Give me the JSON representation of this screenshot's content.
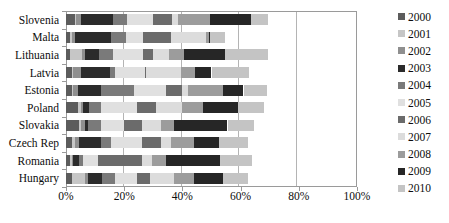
{
  "chart_data": {
    "type": "bar",
    "orientation": "horizontal",
    "stacked": true,
    "normalized_percent": true,
    "title": "",
    "subtitle": "",
    "xlabel": "",
    "ylabel": "",
    "xlim": [
      0,
      100
    ],
    "xticks": [
      0,
      20,
      40,
      60,
      80,
      100
    ],
    "xtick_labels": [
      "0%",
      "20%",
      "40%",
      "60%",
      "80%",
      "100%"
    ],
    "grid": true,
    "grid_axis": "x",
    "legend_position": "right",
    "categories": [
      "Slovenia",
      "Malta",
      "Lithuania",
      "Latvia",
      "Estonia",
      "Poland",
      "Slovakia",
      "Czech Rep",
      "Romania",
      "Hungary"
    ],
    "series": [
      {
        "name": "2000",
        "color": "#5c5c5c",
        "values": [
          3.0,
          1.5,
          1.5,
          2.0,
          2.0,
          4.0,
          4.5,
          2.0,
          1.5,
          2.0
        ]
      },
      {
        "name": "2001",
        "color": "#c6c6c6",
        "values": [
          0.5,
          0.5,
          4.0,
          0.5,
          0.5,
          1.0,
          0.5,
          1.0,
          0.5,
          4.5
        ]
      },
      {
        "name": "2002",
        "color": "#8f8f8f",
        "values": [
          1.5,
          1.0,
          1.0,
          2.5,
          1.5,
          1.0,
          1.5,
          1.5,
          0.5,
          1.0
        ]
      },
      {
        "name": "2003",
        "color": "#2b2b2b",
        "values": [
          11.0,
          12.5,
          5.0,
          10.0,
          8.0,
          2.0,
          1.0,
          7.5,
          2.0,
          5.0
        ]
      },
      {
        "name": "2004",
        "color": "#7a7a7a",
        "values": [
          5.0,
          5.0,
          4.5,
          2.0,
          11.5,
          4.0,
          4.5,
          3.5,
          1.5,
          4.5
        ]
      },
      {
        "name": "2005",
        "color": "#e0e0e0",
        "values": [
          9.0,
          6.0,
          10.5,
          10.0,
          11.0,
          12.5,
          8.0,
          10.5,
          5.0,
          7.5
        ]
      },
      {
        "name": "2006",
        "color": "#6b6b6b",
        "values": [
          6.5,
          9.5,
          3.5,
          0.5,
          5.5,
          6.5,
          6.0,
          6.5,
          15.0,
          4.5
        ]
      },
      {
        "name": "2007",
        "color": "#dcdcdc",
        "values": [
          2.0,
          12.0,
          5.5,
          12.0,
          2.0,
          9.0,
          6.5,
          3.5,
          3.5,
          8.0
        ]
      },
      {
        "name": "2008",
        "color": "#9c9c9c",
        "values": [
          11.0,
          1.0,
          5.0,
          5.0,
          12.0,
          7.0,
          4.5,
          8.0,
          5.0,
          7.0
        ]
      },
      {
        "name": "2009",
        "color": "#262626",
        "values": [
          14.0,
          0.5,
          14.0,
          5.5,
          7.0,
          12.0,
          18.5,
          8.5,
          18.5,
          10.0
        ]
      },
      {
        "name": "2010",
        "color": "#c4c4c4",
        "values": [
          6.0,
          5.0,
          15.0,
          13.0,
          8.0,
          9.0,
          9.0,
          10.0,
          11.0,
          8.5
        ]
      }
    ],
    "series_totals": [
      69.5,
      54.5,
      69.5,
      63.0,
      69.0,
      68.0,
      64.5,
      62.5,
      64.0,
      62.5
    ]
  },
  "legend": {
    "items": [
      {
        "label": "2000",
        "color": "#5c5c5c"
      },
      {
        "label": "2001",
        "color": "#c6c6c6"
      },
      {
        "label": "2002",
        "color": "#8f8f8f"
      },
      {
        "label": "2003",
        "color": "#2b2b2b"
      },
      {
        "label": "2004",
        "color": "#7a7a7a"
      },
      {
        "label": "2005",
        "color": "#e0e0e0"
      },
      {
        "label": "2006",
        "color": "#6b6b6b"
      },
      {
        "label": "2007",
        "color": "#dcdcdc"
      },
      {
        "label": "2008",
        "color": "#9c9c9c"
      },
      {
        "label": "2009",
        "color": "#262626"
      },
      {
        "label": "2010",
        "color": "#c4c4c4"
      }
    ]
  },
  "axis": {
    "x_tick_labels": [
      "0%",
      "20%",
      "40%",
      "60%",
      "80%",
      "100%"
    ],
    "y_tick_labels": [
      "Slovenia",
      "Malta",
      "Lithuania",
      "Latvia",
      "Estonia",
      "Poland",
      "Slovakia",
      "Czech Rep",
      "Romania",
      "Hungary"
    ]
  },
  "style": {
    "plot_border_color": "#9a9a9a",
    "gridline_color": "#b4b4b4",
    "background": "#ffffff",
    "text_color": "#0d0d0d"
  }
}
